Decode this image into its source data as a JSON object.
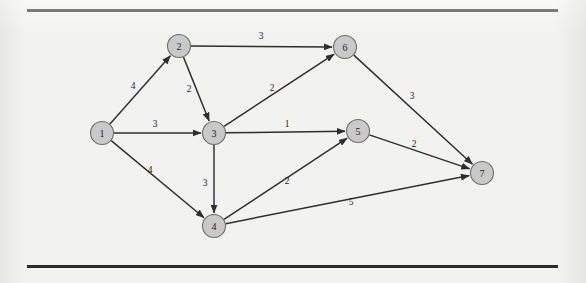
{
  "figure": {
    "background_color": "#f2f2f0",
    "rule_color": "#2b2b2e",
    "node_fill": "#c9c9c9",
    "node_stroke": "#6d6d6d",
    "edge_color": "#2e2e32"
  },
  "chart_data": {
    "type": "diagram",
    "diagram_kind": "directed-weighted-graph",
    "title": "",
    "xlabel": "",
    "ylabel": "",
    "grid": false,
    "legend": null,
    "nodes": [
      {
        "id": "1",
        "label": "1",
        "x": 102,
        "y": 133,
        "r": 11.5
      },
      {
        "id": "2",
        "label": "2",
        "x": 179,
        "y": 46,
        "r": 11.5
      },
      {
        "id": "3",
        "label": "3",
        "x": 214,
        "y": 133,
        "r": 11.5
      },
      {
        "id": "4",
        "label": "4",
        "x": 214,
        "y": 226,
        "r": 11.5
      },
      {
        "id": "5",
        "label": "5",
        "x": 358,
        "y": 131,
        "r": 11.5
      },
      {
        "id": "6",
        "label": "6",
        "x": 345,
        "y": 47,
        "r": 11.5
      },
      {
        "id": "7",
        "label": "7",
        "x": 482,
        "y": 173,
        "r": 11.5
      }
    ],
    "edges": [
      {
        "from": "1",
        "to": "2",
        "weight": "4",
        "label_x": 133,
        "label_y": 86
      },
      {
        "from": "1",
        "to": "3",
        "weight": "3",
        "label_x": 155,
        "label_y": 124
      },
      {
        "from": "1",
        "to": "4",
        "weight": "4",
        "label_x": 150,
        "label_y": 170
      },
      {
        "from": "2",
        "to": "6",
        "weight": "3",
        "label_x": 261,
        "label_y": 36
      },
      {
        "from": "2",
        "to": "3",
        "weight": "2",
        "label_x": 189,
        "label_y": 89
      },
      {
        "from": "3",
        "to": "6",
        "weight": "2",
        "label_x": 272,
        "label_y": 88
      },
      {
        "from": "3",
        "to": "5",
        "weight": "1",
        "label_x": 287,
        "label_y": 124
      },
      {
        "from": "3",
        "to": "4",
        "weight": "3",
        "label_x": 205,
        "label_y": 183
      },
      {
        "from": "4",
        "to": "5",
        "weight": "2",
        "label_x": 287,
        "label_y": 181
      },
      {
        "from": "4",
        "to": "7",
        "weight": "5",
        "label_x": 351,
        "label_y": 202
      },
      {
        "from": "5",
        "to": "7",
        "weight": "2",
        "label_x": 414,
        "label_y": 144
      },
      {
        "from": "6",
        "to": "7",
        "weight": "3",
        "label_x": 412,
        "label_y": 96
      }
    ]
  }
}
